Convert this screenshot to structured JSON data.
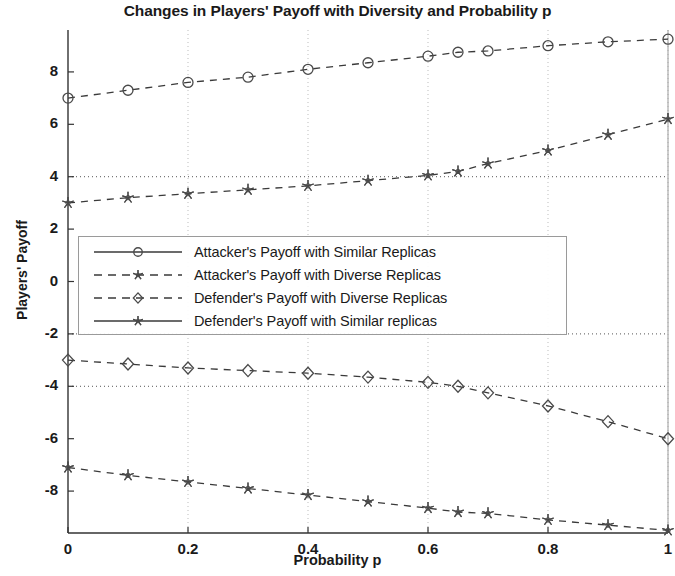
{
  "chart_data": {
    "type": "line",
    "title": "Changes in Players' Payoff with Diversity and Probability p",
    "xlabel": "Probability p",
    "ylabel": "Players' Payoff",
    "xlim": [
      0,
      1
    ],
    "ylim": [
      -9.6,
      9.6
    ],
    "xticks": [
      "0",
      "0.2",
      "0.4",
      "0.6",
      "0.8",
      "1"
    ],
    "xtick_values": [
      0,
      0.2,
      0.4,
      0.6,
      0.8,
      1
    ],
    "yticks": [
      "8",
      "6",
      "4",
      "2",
      "0",
      "-2",
      "-4",
      "-6",
      "-8"
    ],
    "ytick_values": [
      8,
      6,
      4,
      2,
      0,
      -2,
      -4,
      -6,
      -8
    ],
    "grid": "dotted vertical gridlines at x ticks; dotted horizontal reference lines at y = 4, -2, -4",
    "reference_lines": [
      4,
      -2,
      -4
    ],
    "legend_position": "center-left inside axes",
    "x": [
      0,
      0.1,
      0.2,
      0.3,
      0.4,
      0.5,
      0.6,
      0.65,
      0.7,
      0.8,
      0.9,
      1
    ],
    "series": [
      {
        "name": "Attacker's Payoff with Similar Replicas",
        "marker": "circle",
        "linestyle": "dashed",
        "values": [
          7.0,
          7.3,
          7.6,
          7.8,
          8.1,
          8.35,
          8.6,
          8.75,
          8.8,
          9.0,
          9.15,
          9.25
        ]
      },
      {
        "name": "Attacker's Payoff with Diverse Replicas",
        "marker": "asterisk",
        "linestyle": "dashed",
        "values": [
          3.0,
          3.2,
          3.35,
          3.5,
          3.65,
          3.85,
          4.05,
          4.2,
          4.5,
          5.0,
          5.6,
          6.2
        ]
      },
      {
        "name": "Defender's Payoff with Diverse Replicas",
        "marker": "diamond",
        "linestyle": "dashed",
        "values": [
          -3.0,
          -3.15,
          -3.3,
          -3.4,
          -3.5,
          -3.65,
          -3.85,
          -4.0,
          -4.25,
          -4.75,
          -5.35,
          -6.0
        ]
      },
      {
        "name": "Defender's Payoff with Similar replicas",
        "marker": "star",
        "linestyle": "dashed",
        "values": [
          -7.1,
          -7.4,
          -7.65,
          -7.9,
          -8.15,
          -8.4,
          -8.65,
          -8.8,
          -8.85,
          -9.1,
          -9.3,
          -9.5
        ]
      }
    ],
    "colors": {
      "axis": "#333333",
      "series_line": "#3a3a3a",
      "gridline": "#bdbdbd",
      "background": "#ffffff"
    }
  },
  "legend": {
    "items": [
      {
        "label": "Attacker's Payoff with Similar Replicas",
        "marker": "circle",
        "linestyle": "solid"
      },
      {
        "label": "Attacker's Payoff with Diverse Replicas",
        "marker": "asterisk",
        "linestyle": "dashed"
      },
      {
        "label": "Defender's Payoff with Diverse Replicas",
        "marker": "diamond",
        "linestyle": "dashed"
      },
      {
        "label": "Defender's Payoff with Similar replicas",
        "marker": "star",
        "linestyle": "solid"
      }
    ]
  }
}
